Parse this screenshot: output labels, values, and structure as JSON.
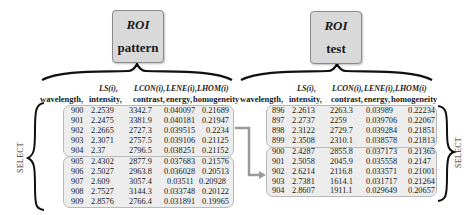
{
  "pattern": {
    "roi_label": "ROI",
    "name": "pattern",
    "headers": {
      "feature_labels": [
        "LS(i),",
        "LCON(i),",
        "LENE(i),",
        "LHOM(i)"
      ],
      "column_labels": [
        "wavelength,",
        "intensity,",
        "contrast,",
        "energy,",
        "homogeneity"
      ]
    },
    "groups": [
      {
        "rows": [
          [
            "900",
            "2.2539",
            "3342.7",
            "0.040097",
            "0.21689"
          ],
          [
            "901",
            "2.2475",
            "3381.9",
            "0.040181",
            "0.21947"
          ],
          [
            "902",
            "2.2665",
            "2727.3",
            "0.039515",
            "0.2234"
          ],
          [
            "903",
            "2.3071",
            "2757.5",
            "0.039106",
            "0.21125"
          ],
          [
            "904",
            "2.37",
            "2796.5",
            "0.038251",
            "0.21152"
          ]
        ]
      },
      {
        "rows": [
          [
            "905",
            "2.4302",
            "2877.9",
            "0.037683",
            "0.21576"
          ],
          [
            "906",
            "2.5027",
            "2963.8",
            "0.036028",
            "0.20513"
          ],
          [
            "907",
            "2.609",
            "3057.4",
            "0.03511",
            "0.20928"
          ],
          [
            "908",
            "2.7527",
            "3144.3",
            "0.033748",
            "0.20122"
          ],
          [
            "909",
            "2.8576",
            "2766.4",
            "0.031891",
            "0.19965"
          ]
        ]
      }
    ],
    "side_label": "SELECT"
  },
  "test": {
    "roi_label": "ROI",
    "name": "test",
    "headers": {
      "feature_labels": [
        "LS(i),",
        "LCON(i),",
        "LENE(i),",
        "LHOM(i)"
      ],
      "column_labels": [
        "wavelength,",
        "intensity,",
        "contrast,",
        "energy,",
        "homogeneity"
      ]
    },
    "groups": [
      {
        "rows": [
          [
            "896",
            "2.2613",
            "2263.3",
            "0.03989",
            "0.22234"
          ],
          [
            "897",
            "2.2737",
            "2259",
            "0.039706",
            "0.22067"
          ],
          [
            "898",
            "2.3122",
            "2729.7",
            "0.039284",
            "0.21851"
          ],
          [
            "899",
            "2.3508",
            "2310.1",
            "0.038578",
            "0.21813"
          ]
        ]
      },
      {
        "rows": [
          [
            "900",
            "2.4287",
            "2855.8",
            "0.037173",
            "0.21365"
          ],
          [
            "901",
            "2.5058",
            "2045.9",
            "0.035558",
            "0.2147"
          ],
          [
            "902",
            "2.6214",
            "2116.8",
            "0.033571",
            "0.21001"
          ],
          [
            "903",
            "2.7381",
            "1614.1",
            "0.031717",
            "0.21264"
          ],
          [
            "904",
            "2.8607",
            "1911.1",
            "0.029649",
            "0.20657"
          ]
        ]
      }
    ],
    "side_label": "SELECT"
  },
  "colors": {
    "box_fill": "#d9d9d9",
    "table_fill": "#ededed",
    "connector": "#9a9a9a"
  }
}
